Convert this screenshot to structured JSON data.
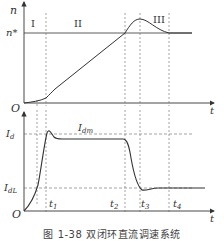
{
  "figure": {
    "caption": "图 1-38   双闭环直流调速系统"
  },
  "speed_plot": {
    "y_label": "n",
    "ref_label": "n*",
    "x_label": "t",
    "origin_label": "O",
    "stage_labels": [
      "I",
      "II",
      "III"
    ]
  },
  "current_plot": {
    "y_labels": {
      "Id": "I",
      "Id_sub": "d",
      "IdL": "I",
      "IdL_sub": "dL"
    },
    "curve_label": "I",
    "curve_label_sub": "dm",
    "x_label": "t",
    "origin_label": "O",
    "time_ticks": [
      {
        "label": "t",
        "sub": "1"
      },
      {
        "label": "t",
        "sub": "2"
      },
      {
        "label": "t",
        "sub": "3"
      },
      {
        "label": "t",
        "sub": "4"
      }
    ]
  },
  "colors": {
    "line": "#333333",
    "dash": "#666666"
  }
}
